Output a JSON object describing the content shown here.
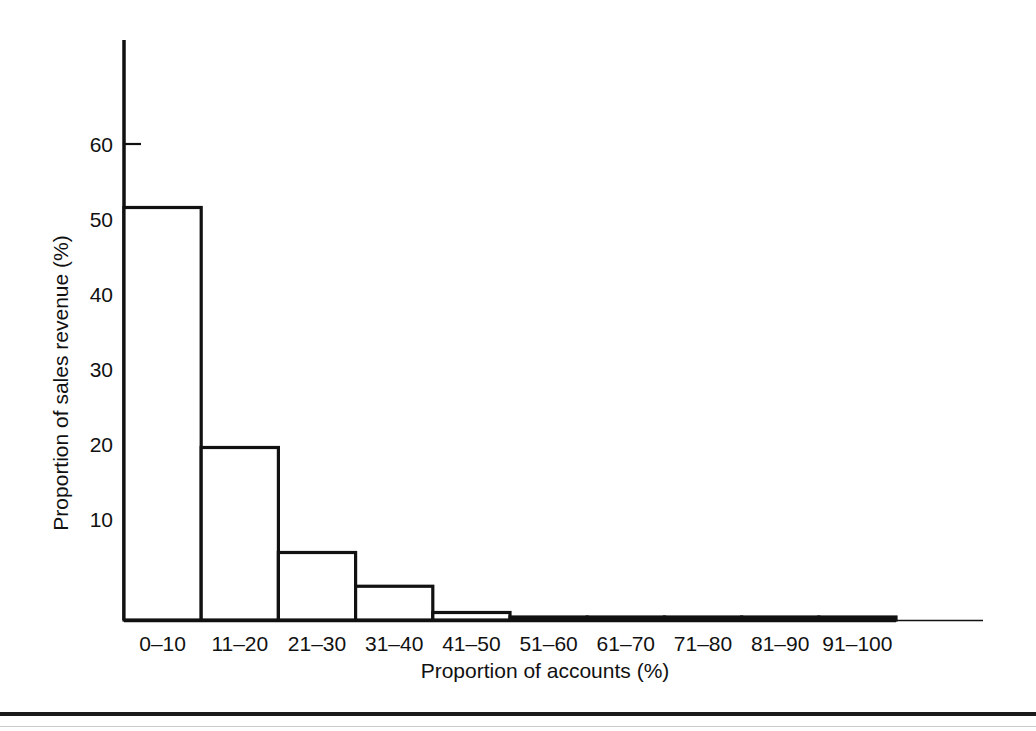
{
  "figure": {
    "background_color": "#ffffff",
    "ink_color": "#111111"
  },
  "chart_data": {
    "type": "bar",
    "title": "",
    "subtitle": "",
    "xlabel": "Proportion of accounts (%)",
    "ylabel": "Proportion of sales revenue (%)",
    "categories": [
      "0–10",
      "11–20",
      "21–30",
      "31–40",
      "41–50",
      "51–60",
      "61–70",
      "71–80",
      "81–90",
      "91–100"
    ],
    "values": [
      55,
      23,
      9,
      4.5,
      1,
      0.4,
      0.4,
      0.4,
      0.4,
      0.4
    ],
    "series": [
      {
        "name": "Proportion of sales revenue",
        "values": [
          55,
          23,
          9,
          4.5,
          1,
          0.4,
          0.4,
          0.4,
          0.4,
          0.4
        ]
      }
    ],
    "ylim": [
      0,
      68
    ],
    "xlim": [
      0,
      10
    ],
    "y_ticks": [
      10,
      20,
      30,
      40,
      50,
      60
    ],
    "y_tick_labels": [
      "10",
      "20",
      "30",
      "40",
      "50",
      "60"
    ],
    "grid": false,
    "legend": null,
    "legend_position": "none",
    "bar_style": "histogram-outline",
    "bar_fill": "#ffffff",
    "bar_edge": "#111111"
  }
}
